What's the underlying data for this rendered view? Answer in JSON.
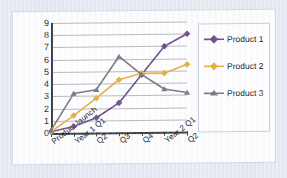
{
  "chart_data": {
    "type": "line",
    "title": "",
    "xlabel": "",
    "ylabel": "",
    "ylim": [
      0,
      9
    ],
    "yticks": [
      0,
      1,
      2,
      3,
      4,
      5,
      6,
      7,
      8,
      9
    ],
    "grid": true,
    "legend_position": "right",
    "categories": [
      "Product launch",
      "Year 1 Q1",
      "Q2",
      "Q3",
      "Q4",
      "Year 2 Q1",
      "Q2"
    ],
    "series": [
      {
        "name": "Product 1",
        "color": "#6B4C8A",
        "marker": "diamond",
        "values": [
          0.1,
          0.5,
          1.2,
          2.4,
          4.7,
          7.0,
          8.0
        ]
      },
      {
        "name": "Product 2",
        "color": "#E8AE3C",
        "marker": "diamond",
        "values": [
          0.1,
          1.4,
          2.8,
          4.3,
          4.8,
          4.8,
          5.5
        ]
      },
      {
        "name": "Product 3",
        "color": "#76787F",
        "marker": "triangle",
        "values": [
          0.2,
          3.2,
          3.5,
          6.2,
          4.7,
          3.5,
          3.2
        ]
      }
    ]
  },
  "legend": {
    "items": [
      {
        "label": "Product 1"
      },
      {
        "label": "Product 2"
      },
      {
        "label": "Product 3"
      }
    ]
  }
}
